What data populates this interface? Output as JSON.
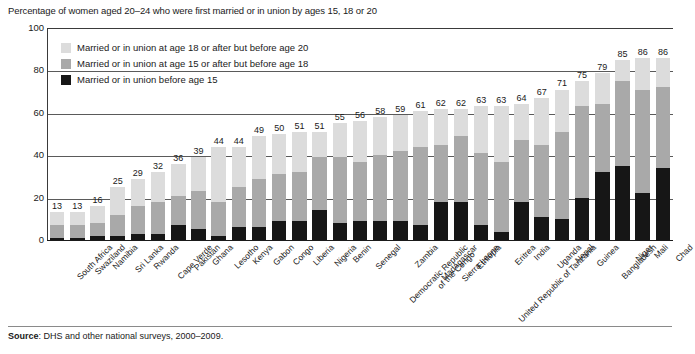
{
  "title": "Percentage of women aged 20–24 who were first married or in union by ages 15, 18 or 20",
  "source_prefix": "Source",
  "source_text": ": DHS and other national surveys, 2000–2009.",
  "colors": {
    "before15": "#161616",
    "age15to18": "#a9a9a9",
    "age18to20": "#dcdcdc",
    "axis": "#1a1a1a",
    "grid": "#5a5a5a"
  },
  "legend": [
    {
      "label": "Married or in union at age 18 or after but before age 20",
      "color": "#dcdcdc",
      "key": "age18to20"
    },
    {
      "label": "Married or in union at age 15 or after but before age 18",
      "color": "#a9a9a9",
      "key": "age15to18"
    },
    {
      "label": "Married or in union before age 15",
      "color": "#161616",
      "key": "before15"
    }
  ],
  "chart_data": {
    "type": "bar",
    "subtype": "stacked-vertical",
    "title": "Percentage of women aged 20–24 who were first married or in union by ages 15, 18 or 20",
    "xlabel": "",
    "ylabel": "",
    "ylim": [
      0,
      100
    ],
    "yticks": [
      0,
      20,
      40,
      60,
      80,
      100
    ],
    "grid": true,
    "grid_axis": "y",
    "legend_position": "inside-top-left",
    "categories": [
      "South Africa",
      "Swaziland",
      "Namibia",
      "Sri Lanka",
      "Rwanda",
      "Cape Verde",
      "Pakistan",
      "Ghana",
      "Lesotho",
      "Kenya",
      "Gabon",
      "Congo",
      "Liberia",
      "Nigeria",
      "Benin",
      "Senegal",
      "Democratic Republic of the Congo",
      "Zambia",
      "Madagascar",
      "Sierra Leone",
      "Ethiopia",
      "United Republic of Tanzania",
      "Eritrea",
      "India",
      "Uganda",
      "Nepal",
      "Guinea",
      "Bangladesh",
      "Niger",
      "Mali",
      "Chad"
    ],
    "category_lines": [
      [
        "South Africa"
      ],
      [
        "Swaziland"
      ],
      [
        "Namibia"
      ],
      [
        "Sri Lanka"
      ],
      [
        "Rwanda"
      ],
      [
        "Cape Verde"
      ],
      [
        "Pakistan"
      ],
      [
        "Ghana"
      ],
      [
        "Lesotho"
      ],
      [
        "Kenya"
      ],
      [
        "Gabon"
      ],
      [
        "Congo"
      ],
      [
        "Liberia"
      ],
      [
        "Nigeria"
      ],
      [
        "Benin"
      ],
      [
        "Senegal"
      ],
      [
        "Democratic Republic",
        "of the Congo"
      ],
      [
        "Zambia"
      ],
      [
        "Madagascar"
      ],
      [
        "Sierra Leone"
      ],
      [
        "Ethiopia"
      ],
      [
        "United Republic of Tanzania"
      ],
      [
        "Eritrea"
      ],
      [
        "India"
      ],
      [
        "Uganda"
      ],
      [
        "Nepal"
      ],
      [
        "Guinea"
      ],
      [
        "Bangladesh"
      ],
      [
        "Niger"
      ],
      [
        "Mali"
      ],
      [
        "Chad"
      ]
    ],
    "totals": [
      13,
      13,
      16,
      25,
      29,
      32,
      36,
      39,
      44,
      44,
      49,
      50,
      51,
      51,
      55,
      56,
      58,
      59,
      61,
      62,
      62,
      63,
      63,
      64,
      67,
      71,
      75,
      79,
      85,
      86,
      86
    ],
    "series": [
      {
        "name": "Married or in union before age 15",
        "key": "before15",
        "color": "#161616",
        "values": [
          1,
          1,
          2,
          2,
          3,
          3,
          7,
          5,
          2,
          6,
          6,
          9,
          9,
          14,
          8,
          9,
          9,
          9,
          7,
          18,
          18,
          7,
          4,
          18,
          11,
          10,
          20,
          32,
          35,
          22,
          34
        ]
      },
      {
        "name": "Married or in union at age 15 or after but before age 18",
        "key": "age15to18",
        "color": "#a9a9a9",
        "values": [
          6,
          6,
          6,
          10,
          13,
          15,
          14,
          18,
          16,
          19,
          23,
          22,
          23,
          25,
          31,
          28,
          31,
          33,
          37,
          27,
          31,
          34,
          33,
          29,
          34,
          41,
          43,
          32,
          40,
          49,
          38
        ]
      },
      {
        "name": "Married or in union at age 18 or after but before age 20",
        "key": "age18to20",
        "color": "#dcdcdc",
        "values": [
          6,
          6,
          8,
          13,
          13,
          14,
          15,
          16,
          26,
          19,
          20,
          19,
          19,
          12,
          16,
          19,
          18,
          17,
          17,
          17,
          13,
          22,
          26,
          17,
          22,
          20,
          12,
          15,
          10,
          15,
          14
        ]
      }
    ]
  },
  "footer": {
    "rule": true
  }
}
